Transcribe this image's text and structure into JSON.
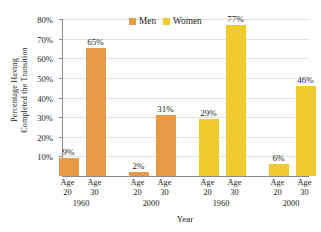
{
  "chart_data": {
    "type": "bar",
    "title": "",
    "xlabel": "Year",
    "ylabel_line1": "Percentage Having",
    "ylabel_line2": "Completed the Transition",
    "ylim": [
      0,
      80
    ],
    "ytick_values": [
      10,
      20,
      30,
      40,
      50,
      60,
      70,
      80
    ],
    "ytick_labels": [
      "10%",
      "20%",
      "30%",
      "40%",
      "50%",
      "60%",
      "70%",
      "80%"
    ],
    "grid": true,
    "legend_position": "top-center",
    "legend": [
      {
        "name": "Men",
        "color": "#e89b45"
      },
      {
        "name": "Women",
        "color": "#f0cb2f"
      }
    ],
    "age_labels": [
      {
        "line1": "Age",
        "line2": "20"
      },
      {
        "line1": "Age",
        "line2": "30"
      },
      {
        "line1": "Age",
        "line2": "20"
      },
      {
        "line1": "Age",
        "line2": "30"
      },
      {
        "line1": "Age",
        "line2": "20"
      },
      {
        "line1": "Age",
        "line2": "30"
      },
      {
        "line1": "Age",
        "line2": "20"
      },
      {
        "line1": "Age",
        "line2": "30"
      }
    ],
    "year_groups": [
      {
        "label": "1960",
        "series": "Men"
      },
      {
        "label": "2000",
        "series": "Men"
      },
      {
        "label": "1960",
        "series": "Women"
      },
      {
        "label": "2000",
        "series": "Women"
      }
    ],
    "bars": [
      {
        "series": "Men",
        "year": "1960",
        "age": "20",
        "value": 9,
        "label": "9%",
        "color": "#e89b45"
      },
      {
        "series": "Men",
        "year": "1960",
        "age": "30",
        "value": 65,
        "label": "65%",
        "color": "#e89b45"
      },
      {
        "series": "Men",
        "year": "2000",
        "age": "20",
        "value": 2,
        "label": "2%",
        "color": "#e89b45"
      },
      {
        "series": "Men",
        "year": "2000",
        "age": "30",
        "value": 31,
        "label": "31%",
        "color": "#e89b45"
      },
      {
        "series": "Women",
        "year": "1960",
        "age": "20",
        "value": 29,
        "label": "29%",
        "color": "#f0cb2f"
      },
      {
        "series": "Women",
        "year": "1960",
        "age": "30",
        "value": 77,
        "label": "77%",
        "color": "#f0cb2f"
      },
      {
        "series": "Women",
        "year": "2000",
        "age": "20",
        "value": 6,
        "label": "6%",
        "color": "#f0cb2f"
      },
      {
        "series": "Women",
        "year": "2000",
        "age": "30",
        "value": 46,
        "label": "46%",
        "color": "#f0cb2f"
      }
    ]
  }
}
